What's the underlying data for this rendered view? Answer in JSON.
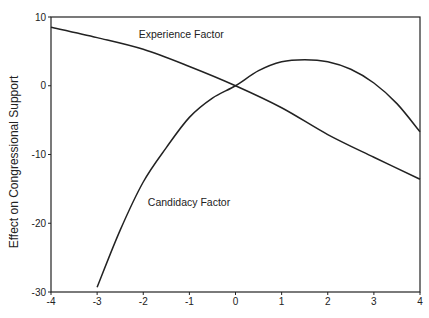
{
  "chart_data": {
    "type": "line",
    "title": "",
    "xlabel": "",
    "ylabel": "Effect on Congressional Support",
    "xlim": [
      -4,
      4
    ],
    "ylim": [
      -30,
      10
    ],
    "grid": false,
    "legend": "inline labels",
    "x_ticks": [
      -4,
      -3,
      -2,
      -1,
      0,
      1,
      2,
      3,
      4
    ],
    "y_ticks": [
      10,
      0,
      -10,
      -20,
      -30
    ],
    "series": [
      {
        "name": "Experience Factor",
        "label_position": {
          "x": -2.1,
          "y": 7.0
        },
        "x": [
          -4,
          -3,
          -2,
          -1,
          0,
          1,
          2,
          3,
          4
        ],
        "values": [
          8.5,
          7.0,
          5.3,
          2.8,
          0.0,
          -3.2,
          -7.1,
          -10.4,
          -13.6
        ]
      },
      {
        "name": "Candidacy Factor",
        "label_position": {
          "x": -1.9,
          "y": -17.5
        },
        "x": [
          -3,
          -2.5,
          -2,
          -1.5,
          -1,
          -0.5,
          0,
          0.5,
          1,
          1.5,
          2,
          2.5,
          3,
          3.5,
          4
        ],
        "values": [
          -29.3,
          -21.0,
          -14.0,
          -9.0,
          -4.6,
          -1.8,
          0.0,
          2.2,
          3.5,
          3.8,
          3.5,
          2.4,
          0.4,
          -2.6,
          -6.7
        ]
      }
    ]
  }
}
